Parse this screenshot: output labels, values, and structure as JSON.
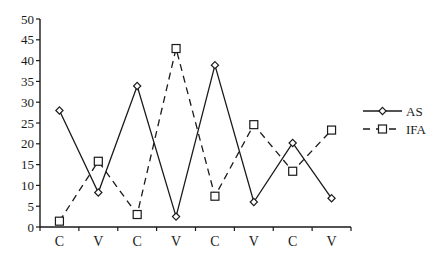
{
  "chart_data": {
    "type": "line",
    "title": "",
    "xlabel": "",
    "ylabel": "",
    "categories": [
      "C",
      "V",
      "C",
      "V",
      "C",
      "V",
      "C",
      "V"
    ],
    "ylim": [
      0,
      50
    ],
    "yticks": [
      0,
      5,
      10,
      15,
      20,
      25,
      30,
      35,
      40,
      45,
      50
    ],
    "grid": false,
    "legend_position": "right",
    "series": [
      {
        "name": "AS",
        "line_style": "solid",
        "marker": "diamond",
        "color": "#1a1a1a",
        "values": [
          28,
          8.3,
          33.9,
          2.5,
          38.9,
          6,
          20.2,
          6.9
        ]
      },
      {
        "name": "IFA",
        "line_style": "dashed",
        "marker": "square",
        "color": "#1a1a1a",
        "values": [
          1.4,
          15.8,
          3,
          42.9,
          7.4,
          24.6,
          13.4,
          23.3
        ]
      }
    ]
  }
}
